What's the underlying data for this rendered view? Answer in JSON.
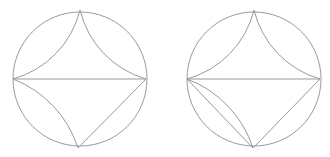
{
  "figures": [
    {
      "name": "left-disk",
      "circle": {
        "cx": 80,
        "cy": 79,
        "r": 67
      },
      "points": {
        "left": [
          13,
          79
        ],
        "top": [
          80,
          10
        ],
        "right": [
          146,
          79
        ],
        "bottom": [
          78,
          148
        ]
      },
      "geodesics": [
        {
          "type": "arc",
          "from": "left",
          "to": "top",
          "r": 95,
          "sweep": 0
        },
        {
          "type": "arc",
          "from": "top",
          "to": "right",
          "r": 95,
          "sweep": 0
        },
        {
          "type": "line",
          "from": "left",
          "to": "right"
        },
        {
          "type": "arc",
          "from": "left",
          "to": "bottom",
          "r": 110,
          "sweep": 1
        },
        {
          "type": "line",
          "from": "bottom",
          "to": "right"
        }
      ]
    },
    {
      "name": "right-disk",
      "circle": {
        "cx": 254,
        "cy": 79,
        "r": 67
      },
      "points": {
        "left": [
          187,
          79
        ],
        "top": [
          254,
          10
        ],
        "right": [
          320,
          79
        ],
        "bottom": [
          253,
          148
        ]
      },
      "geodesics": [
        {
          "type": "arc",
          "from": "left",
          "to": "top",
          "r": 95,
          "sweep": 0
        },
        {
          "type": "arc",
          "from": "top",
          "to": "right",
          "r": 95,
          "sweep": 0
        },
        {
          "type": "line",
          "from": "left",
          "to": "right"
        },
        {
          "type": "arc",
          "from": "left",
          "to": "bottom",
          "r": 110,
          "sweep": 1
        },
        {
          "type": "line",
          "from": "left",
          "to": "bottom"
        },
        {
          "type": "line",
          "from": "bottom",
          "to": "right"
        }
      ]
    }
  ],
  "colors": {
    "stroke": "#9a9a9a",
    "background": "#ffffff"
  }
}
